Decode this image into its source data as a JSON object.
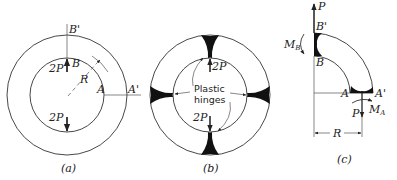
{
  "figure": {
    "panels": [
      {
        "id": "a",
        "caption": "(a)",
        "labels": {
          "top_outer": "B'",
          "top_inner": "B",
          "right_inner": "A",
          "right_outer": "A'",
          "radius": "R",
          "load_top": "2P",
          "load_bottom": "2P"
        }
      },
      {
        "id": "b",
        "caption": "(b)",
        "labels": {
          "hinge_line1": "Plastic",
          "hinge_line2": "hinges",
          "load_top": "2P",
          "load_bottom": "2P"
        }
      },
      {
        "id": "c",
        "caption": "(c)",
        "labels": {
          "top_force": "P",
          "top_outer": "B'",
          "top_inner": "B",
          "moment_b": "M",
          "moment_b_sub": "B",
          "inner_a": "A",
          "outer_a": "A'",
          "bottom_force": "P",
          "moment_a": "M",
          "moment_a_sub": "A",
          "dimension": "R"
        }
      }
    ]
  },
  "colors": {
    "stroke": "#333333",
    "hinge_fill": "#111111",
    "background": "#ffffff"
  }
}
